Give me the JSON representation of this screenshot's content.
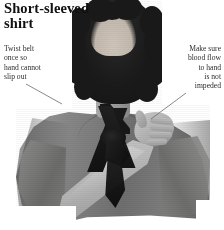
{
  "page": {
    "title": "Short-sleeved shirt",
    "title_lines": [
      "Short-sleeved",
      "shirt"
    ],
    "width": 224,
    "height": 230,
    "background_color": "#ffffff",
    "text_color": "#111111",
    "caption_color": "#2c2c2c",
    "leader_line_color": "#6b6b6b"
  },
  "callouts": {
    "left": {
      "text": "Twist belt once so hand cannot slip out",
      "lines": [
        "Twist belt",
        "once so",
        "hand cannot",
        "slip out"
      ],
      "align": "left"
    },
    "right": {
      "text": "Make sure blood flow to hand is not impeded",
      "lines": [
        "Make sure",
        "blood flow",
        "to hand",
        "is not",
        "impeded"
      ],
      "align": "right"
    }
  },
  "photo": {
    "description": "Black and white photograph of a woman with curly dark shoulder-length hair wearing a short-sleeved gray shirt, with a dark belt used as an improvised arm sling knotted at the neck and around the wrist, her hand resting on the opposite shoulder",
    "subject": "woman demonstrating improvised belt arm sling",
    "color_mode": "grayscale"
  }
}
